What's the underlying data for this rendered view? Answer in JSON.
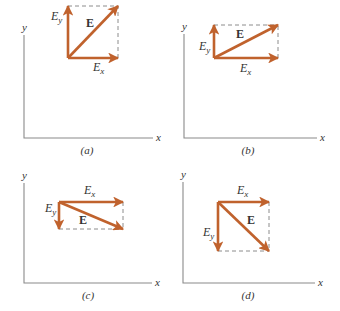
{
  "colors": {
    "vector": "#c0622d",
    "axis": "#8a8a8a",
    "dashed": "#8c8c8c",
    "text": "#333333"
  },
  "labels": {
    "field": "E",
    "ex_base": "E",
    "ex_sub": "x",
    "ey_base": "E",
    "ey_sub": "y",
    "x_axis": "x",
    "y_axis": "y"
  },
  "panels": [
    {
      "id": "a",
      "caption": "(a)",
      "axes": {
        "ox": 24,
        "oy": 138,
        "ytop": 35,
        "xend": 153
      },
      "origin": [
        68,
        58
      ],
      "ex_tip": [
        118,
        58
      ],
      "ey_tip": [
        68,
        6
      ],
      "e_tip": [
        118,
        6
      ],
      "ex_label": [
        93,
        71
      ],
      "ey_label": [
        51,
        20
      ],
      "e_label": [
        86,
        27
      ],
      "caption_pos": [
        87,
        154
      ]
    },
    {
      "id": "b",
      "caption": "(b)",
      "axes": {
        "ox": 184,
        "oy": 138,
        "ytop": 34,
        "xend": 317
      },
      "origin": [
        214,
        58
      ],
      "ex_tip": [
        278,
        58
      ],
      "ey_tip": [
        214,
        25
      ],
      "e_tip": [
        278,
        25
      ],
      "ex_label": [
        240,
        72
      ],
      "ey_label": [
        199,
        50
      ],
      "e_label": [
        236,
        38
      ],
      "caption_pos": [
        248,
        154
      ]
    },
    {
      "id": "c",
      "caption": "(c)",
      "axes": {
        "ox": 24,
        "oy": 283,
        "ytop": 183,
        "xend": 152
      },
      "origin": [
        59,
        202
      ],
      "ex_tip": [
        123,
        202
      ],
      "ey_tip": [
        59,
        229
      ],
      "e_tip": [
        123,
        229
      ],
      "ex_label": [
        84,
        194
      ],
      "ey_label": [
        45,
        212
      ],
      "e_label": [
        79,
        224
      ],
      "caption_pos": [
        88,
        299
      ]
    },
    {
      "id": "d",
      "caption": "(d)",
      "axes": {
        "ox": 183,
        "oy": 283,
        "ytop": 182,
        "xend": 315
      },
      "origin": [
        218,
        202
      ],
      "ex_tip": [
        269,
        202
      ],
      "ey_tip": [
        218,
        251
      ],
      "e_tip": [
        269,
        251
      ],
      "ex_label": [
        237,
        194
      ],
      "ey_label": [
        203,
        236
      ],
      "e_label": [
        247,
        224
      ],
      "caption_pos": [
        248,
        299
      ]
    }
  ]
}
